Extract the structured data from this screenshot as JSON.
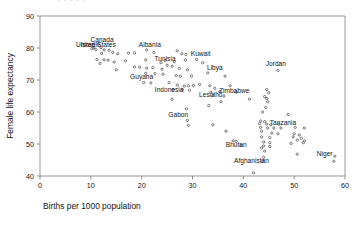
{
  "chart_data": {
    "type": "scatter",
    "title": "",
    "xlabel": "Births per 1000 population",
    "ylabel": "Female life expectancy",
    "xlim": [
      0,
      60
    ],
    "ylim": [
      40,
      90
    ],
    "xticks": [
      0,
      10,
      20,
      30,
      40,
      50,
      60
    ],
    "yticks": [
      40,
      50,
      60,
      70,
      80,
      90
    ],
    "grid": false,
    "legend": "none",
    "marker": "open-circle",
    "marker_color": "#3a3a3a",
    "points": [
      {
        "x": 11.5,
        "y": 81.2,
        "label": "Canada"
      },
      {
        "x": 10.6,
        "y": 80.0,
        "label": "United States"
      },
      {
        "x": 12.0,
        "y": 80.1,
        "label": ""
      },
      {
        "x": 10.2,
        "y": 79.8,
        "label": ""
      },
      {
        "x": 11.0,
        "y": 79.5,
        "label": ""
      },
      {
        "x": 12.6,
        "y": 79.4,
        "label": ""
      },
      {
        "x": 13.6,
        "y": 79.3,
        "label": ""
      },
      {
        "x": 14.3,
        "y": 78.6,
        "label": ""
      },
      {
        "x": 12.1,
        "y": 78.3,
        "label": ""
      },
      {
        "x": 15.3,
        "y": 78.2,
        "label": ""
      },
      {
        "x": 17.4,
        "y": 78.4,
        "label": ""
      },
      {
        "x": 18.6,
        "y": 78.5,
        "label": ""
      },
      {
        "x": 21.0,
        "y": 79.4,
        "label": "Albania"
      },
      {
        "x": 22.4,
        "y": 78.6,
        "label": ""
      },
      {
        "x": 27.0,
        "y": 79.1,
        "label": ""
      },
      {
        "x": 27.9,
        "y": 78.2,
        "label": ""
      },
      {
        "x": 28.7,
        "y": 78.0,
        "label": ""
      },
      {
        "x": 11.2,
        "y": 76.4,
        "label": ""
      },
      {
        "x": 12.6,
        "y": 76.3,
        "label": ""
      },
      {
        "x": 13.4,
        "y": 76.2,
        "label": ""
      },
      {
        "x": 11.8,
        "y": 75.2,
        "label": ""
      },
      {
        "x": 14.6,
        "y": 75.6,
        "label": ""
      },
      {
        "x": 16.8,
        "y": 76.0,
        "label": ""
      },
      {
        "x": 20.8,
        "y": 76.3,
        "label": ""
      },
      {
        "x": 24.6,
        "y": 76.1,
        "label": ""
      },
      {
        "x": 23.8,
        "y": 75.4,
        "label": "Tunisia"
      },
      {
        "x": 26.4,
        "y": 75.7,
        "label": ""
      },
      {
        "x": 28.6,
        "y": 76.2,
        "label": ""
      },
      {
        "x": 30.8,
        "y": 76.4,
        "label": "Kuwait"
      },
      {
        "x": 32.0,
        "y": 75.4,
        "label": ""
      },
      {
        "x": 15.0,
        "y": 73.2,
        "label": ""
      },
      {
        "x": 18.6,
        "y": 74.1,
        "label": ""
      },
      {
        "x": 19.6,
        "y": 74.0,
        "label": ""
      },
      {
        "x": 21.0,
        "y": 73.7,
        "label": ""
      },
      {
        "x": 22.2,
        "y": 73.9,
        "label": ""
      },
      {
        "x": 24.0,
        "y": 73.4,
        "label": ""
      },
      {
        "x": 25.0,
        "y": 74.6,
        "label": ""
      },
      {
        "x": 26.0,
        "y": 74.3,
        "label": ""
      },
      {
        "x": 27.4,
        "y": 73.6,
        "label": ""
      },
      {
        "x": 29.0,
        "y": 73.2,
        "label": ""
      },
      {
        "x": 46.8,
        "y": 73.0,
        "label": "Jordan"
      },
      {
        "x": 20.8,
        "y": 72.1,
        "label": ""
      },
      {
        "x": 22.6,
        "y": 72.0,
        "label": ""
      },
      {
        "x": 24.2,
        "y": 71.8,
        "label": ""
      },
      {
        "x": 26.8,
        "y": 71.4,
        "label": ""
      },
      {
        "x": 27.6,
        "y": 71.2,
        "label": ""
      },
      {
        "x": 29.8,
        "y": 71.2,
        "label": ""
      },
      {
        "x": 33.0,
        "y": 72.2,
        "label": "Libya"
      },
      {
        "x": 36.4,
        "y": 71.2,
        "label": ""
      },
      {
        "x": 20.4,
        "y": 69.2,
        "label": "Guyana"
      },
      {
        "x": 21.8,
        "y": 69.1,
        "label": ""
      },
      {
        "x": 25.4,
        "y": 69.2,
        "label": ""
      },
      {
        "x": 27.0,
        "y": 68.4,
        "label": ""
      },
      {
        "x": 28.4,
        "y": 68.1,
        "label": ""
      },
      {
        "x": 29.2,
        "y": 68.2,
        "label": ""
      },
      {
        "x": 30.2,
        "y": 68.3,
        "label": ""
      },
      {
        "x": 31.4,
        "y": 68.6,
        "label": ""
      },
      {
        "x": 33.4,
        "y": 68.2,
        "label": ""
      },
      {
        "x": 34.4,
        "y": 67.4,
        "label": ""
      },
      {
        "x": 37.4,
        "y": 68.2,
        "label": ""
      },
      {
        "x": 26.2,
        "y": 67.0,
        "label": "Indonesia"
      },
      {
        "x": 28.0,
        "y": 67.0,
        "label": ""
      },
      {
        "x": 29.4,
        "y": 66.8,
        "label": ""
      },
      {
        "x": 33.6,
        "y": 66.2,
        "label": ""
      },
      {
        "x": 35.4,
        "y": 66.4,
        "label": ""
      },
      {
        "x": 44.6,
        "y": 67.0,
        "label": ""
      },
      {
        "x": 45.0,
        "y": 66.0,
        "label": ""
      },
      {
        "x": 34.0,
        "y": 65.2,
        "label": "Lesotho"
      },
      {
        "x": 36.2,
        "y": 65.0,
        "label": ""
      },
      {
        "x": 38.6,
        "y": 66.2,
        "label": "Zimbabwe"
      },
      {
        "x": 44.2,
        "y": 64.8,
        "label": ""
      },
      {
        "x": 26.0,
        "y": 64.0,
        "label": ""
      },
      {
        "x": 35.6,
        "y": 63.2,
        "label": ""
      },
      {
        "x": 41.2,
        "y": 64.0,
        "label": ""
      },
      {
        "x": 44.6,
        "y": 64.2,
        "label": ""
      },
      {
        "x": 44.8,
        "y": 63.2,
        "label": ""
      },
      {
        "x": 33.2,
        "y": 62.0,
        "label": ""
      },
      {
        "x": 44.4,
        "y": 61.4,
        "label": ""
      },
      {
        "x": 28.8,
        "y": 61.0,
        "label": ""
      },
      {
        "x": 43.8,
        "y": 60.0,
        "label": ""
      },
      {
        "x": 48.8,
        "y": 59.2,
        "label": ""
      },
      {
        "x": 29.0,
        "y": 57.4,
        "label": "Gabon"
      },
      {
        "x": 43.4,
        "y": 57.2,
        "label": ""
      },
      {
        "x": 44.2,
        "y": 57.0,
        "label": ""
      },
      {
        "x": 43.2,
        "y": 56.4,
        "label": ""
      },
      {
        "x": 44.6,
        "y": 56.2,
        "label": ""
      },
      {
        "x": 45.4,
        "y": 56.0,
        "label": ""
      },
      {
        "x": 47.0,
        "y": 56.2,
        "label": "Tanzania"
      },
      {
        "x": 29.2,
        "y": 55.8,
        "label": ""
      },
      {
        "x": 34.0,
        "y": 56.0,
        "label": ""
      },
      {
        "x": 43.4,
        "y": 55.2,
        "label": ""
      },
      {
        "x": 44.8,
        "y": 55.0,
        "label": ""
      },
      {
        "x": 46.0,
        "y": 55.0,
        "label": ""
      },
      {
        "x": 47.4,
        "y": 55.0,
        "label": ""
      },
      {
        "x": 50.2,
        "y": 55.2,
        "label": ""
      },
      {
        "x": 52.0,
        "y": 55.0,
        "label": ""
      },
      {
        "x": 43.6,
        "y": 54.0,
        "label": ""
      },
      {
        "x": 36.6,
        "y": 54.0,
        "label": ""
      },
      {
        "x": 45.6,
        "y": 53.4,
        "label": ""
      },
      {
        "x": 46.8,
        "y": 53.2,
        "label": ""
      },
      {
        "x": 50.0,
        "y": 53.2,
        "label": ""
      },
      {
        "x": 51.0,
        "y": 52.8,
        "label": ""
      },
      {
        "x": 43.6,
        "y": 52.2,
        "label": ""
      },
      {
        "x": 45.2,
        "y": 52.0,
        "label": ""
      },
      {
        "x": 49.8,
        "y": 52.2,
        "label": ""
      },
      {
        "x": 51.4,
        "y": 51.8,
        "label": ""
      },
      {
        "x": 50.6,
        "y": 51.2,
        "label": ""
      },
      {
        "x": 52.0,
        "y": 51.0,
        "label": ""
      },
      {
        "x": 38.0,
        "y": 51.0,
        "label": ""
      },
      {
        "x": 38.6,
        "y": 50.8,
        "label": ""
      },
      {
        "x": 44.0,
        "y": 50.6,
        "label": ""
      },
      {
        "x": 45.2,
        "y": 50.4,
        "label": ""
      },
      {
        "x": 49.4,
        "y": 50.2,
        "label": ""
      },
      {
        "x": 51.8,
        "y": 50.4,
        "label": ""
      },
      {
        "x": 39.6,
        "y": 49.6,
        "label": "Bhutan"
      },
      {
        "x": 44.0,
        "y": 49.4,
        "label": ""
      },
      {
        "x": 45.2,
        "y": 49.2,
        "label": ""
      },
      {
        "x": 43.6,
        "y": 48.8,
        "label": ""
      },
      {
        "x": 44.2,
        "y": 47.8,
        "label": ""
      },
      {
        "x": 50.6,
        "y": 46.8,
        "label": ""
      },
      {
        "x": 58.0,
        "y": 46.2,
        "label": "Niger"
      },
      {
        "x": 44.0,
        "y": 45.8,
        "label": ""
      },
      {
        "x": 43.8,
        "y": 44.6,
        "label": "Afghanistan"
      },
      {
        "x": 57.8,
        "y": 44.6,
        "label": ""
      },
      {
        "x": 42.0,
        "y": 41.0,
        "label": ""
      }
    ],
    "annotations": [
      {
        "text": "Canada",
        "x": 12.2,
        "y": 82.0
      },
      {
        "text": "United States",
        "x": 11.0,
        "y": 80.3
      },
      {
        "text": "Israel",
        "x": 9.6,
        "y": 80.3
      },
      {
        "text": "Albania",
        "x": 21.6,
        "y": 80.2
      },
      {
        "text": "Kuwait",
        "x": 31.6,
        "y": 77.4
      },
      {
        "text": "Tunisia",
        "x": 24.6,
        "y": 76.0
      },
      {
        "text": "Jordan",
        "x": 46.4,
        "y": 74.3
      },
      {
        "text": "Libya",
        "x": 34.4,
        "y": 73.2
      },
      {
        "text": "Guyana",
        "x": 20.0,
        "y": 70.4
      },
      {
        "text": "Indonesia",
        "x": 25.4,
        "y": 66.4
      },
      {
        "text": "Lesotho",
        "x": 33.6,
        "y": 64.6
      },
      {
        "text": "Zimbabwe",
        "x": 38.2,
        "y": 66.0
      },
      {
        "text": "Gabon",
        "x": 27.2,
        "y": 58.4
      },
      {
        "text": "Tanzania",
        "x": 47.8,
        "y": 56.0
      },
      {
        "text": "Bhutan",
        "x": 38.6,
        "y": 49.0
      },
      {
        "text": "Afghanistan",
        "x": 41.6,
        "y": 44.0
      },
      {
        "text": "Niger",
        "x": 56.0,
        "y": 46.2
      }
    ]
  },
  "axes": {
    "x_title": "Births per 1000 population",
    "y_title": "Female life expectancy",
    "x_tick_labels": [
      "0",
      "10",
      "20",
      "30",
      "40",
      "50",
      "60"
    ],
    "y_tick_labels": [
      "40",
      "50",
      "60",
      "70",
      "80",
      "90"
    ]
  }
}
